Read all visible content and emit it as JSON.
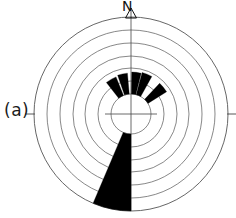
{
  "figure": {
    "panel_label": "(a)",
    "north_label": "N",
    "type": "rose-diagram",
    "colors": {
      "petal_fill": "#000000",
      "grid_stroke": "#555555",
      "axis_stroke": "#444444",
      "background": "#ffffff",
      "text": "#1a1a1a"
    }
  },
  "chart_data": {
    "type": "rose",
    "title": "",
    "subtitle": "",
    "xlabel": "",
    "ylabel": "",
    "legend": [],
    "annotations": [
      "N",
      "(a)"
    ],
    "grid": true,
    "legend_position": "none",
    "center_px": {
      "x": 131,
      "y": 114
    },
    "inner_radius_px": 20,
    "outer_radius_px": 97,
    "n_rings": 7,
    "ring_radii_px": [
      20,
      33,
      46,
      58,
      71,
      84,
      97
    ],
    "axis_ticks_deg": [
      90,
      270
    ],
    "north_marker_deg": 0,
    "sector_width_deg": 15,
    "petals": [
      {
        "center_deg": 330,
        "start_deg": 322,
        "end_deg": 338,
        "radius_px": 40,
        "label": "NNW"
      },
      {
        "center_deg": 348,
        "start_deg": 341,
        "end_deg": 355,
        "radius_px": 41,
        "label": "N-W"
      },
      {
        "center_deg": 7,
        "start_deg": 1,
        "end_deg": 14,
        "radius_px": 42,
        "label": "N-E"
      },
      {
        "center_deg": 22,
        "start_deg": 15,
        "end_deg": 29,
        "radius_px": 43,
        "label": "NNE"
      },
      {
        "center_deg": 50,
        "start_deg": 43,
        "end_deg": 58,
        "radius_px": 42,
        "label": "NE"
      },
      {
        "center_deg": 191,
        "start_deg": 180,
        "end_deg": 203,
        "radius_px": 97,
        "label": "S-SSW"
      }
    ]
  }
}
